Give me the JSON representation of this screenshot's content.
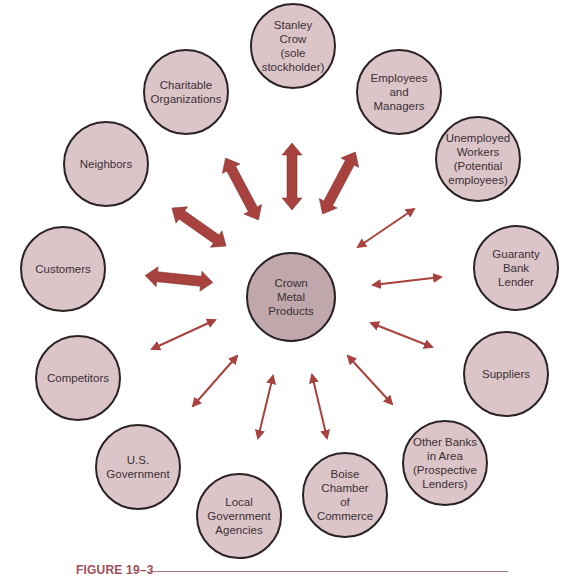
{
  "colors": {
    "node_fill": "#dcc5c9",
    "center_fill": "#bfa7ab",
    "node_border": "#2a2224",
    "arrow": "#a8423e",
    "caption": "#a0505a"
  },
  "center": {
    "label": "Crown\nMetal\nProducts"
  },
  "stakeholders": [
    {
      "id": "stanley-crow",
      "label": "Stanley\nCrow\n(sole\nstockholder)",
      "arrow": "thick"
    },
    {
      "id": "employees",
      "label": "Employees\nand\nManagers",
      "arrow": "thick"
    },
    {
      "id": "unemployed",
      "label": "Unemployed\nWorkers\n(Potential\nemployees)",
      "arrow": "thin"
    },
    {
      "id": "guaranty-bank",
      "label": "Guaranty\nBank\nLender",
      "arrow": "thin"
    },
    {
      "id": "suppliers",
      "label": "Suppliers",
      "arrow": "thin"
    },
    {
      "id": "other-banks",
      "label": "Other Banks\nin Area\n(Prospective\nLenders)",
      "arrow": "thin"
    },
    {
      "id": "boise-chamber",
      "label": "Boise\nChamber\nof\nCommerce",
      "arrow": "thin"
    },
    {
      "id": "local-government",
      "label": "Local\nGovernment\nAgencies",
      "arrow": "thin"
    },
    {
      "id": "us-government",
      "label": "U.S.\nGovernment",
      "arrow": "thin"
    },
    {
      "id": "competitors",
      "label": "Competitors",
      "arrow": "thin"
    },
    {
      "id": "customers",
      "label": "Customers",
      "arrow": "thick"
    },
    {
      "id": "neighbors",
      "label": "Neighbors",
      "arrow": "thick"
    },
    {
      "id": "charitable",
      "label": "Charitable\nOrganizations",
      "arrow": "thick"
    }
  ],
  "caption": {
    "label": "FIGURE 19–3"
  }
}
